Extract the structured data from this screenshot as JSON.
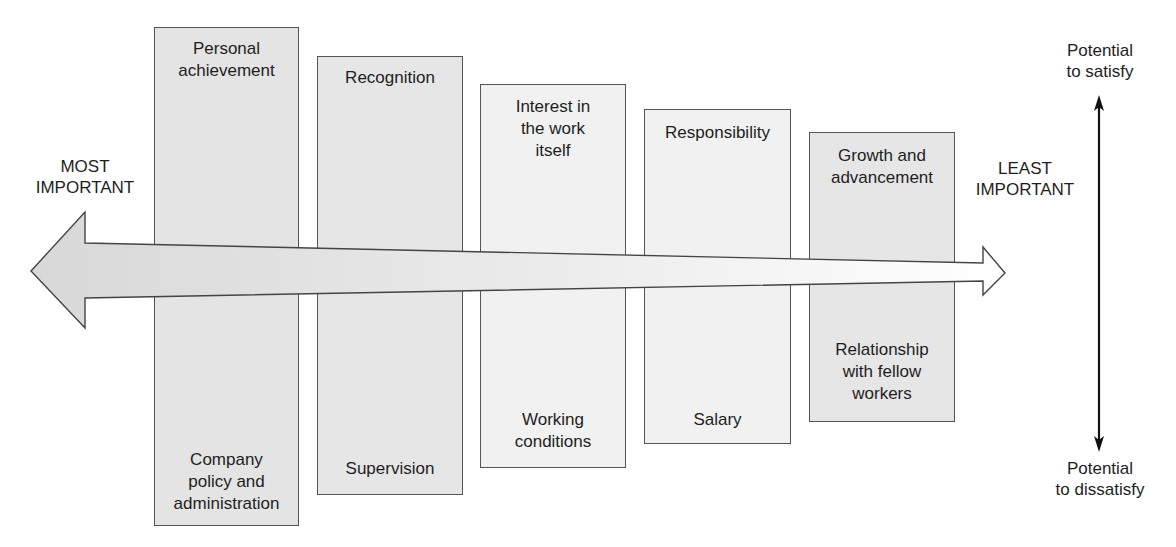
{
  "diagram": {
    "type": "factor-importance-comparison",
    "left_label": "MOST\nIMPORTANT",
    "right_label": "LEAST\nIMPORTANT",
    "axis": {
      "top_label": "Potential\nto satisfy",
      "bottom_label": "Potential\nto dissatisfy"
    },
    "factors": [
      {
        "satisfier": "Personal\nachievement",
        "dissatisfier": "Company\npolicy and\nadministration"
      },
      {
        "satisfier": "Recognition",
        "dissatisfier": "Supervision"
      },
      {
        "satisfier": "Interest in\nthe work\nitself",
        "dissatisfier": "Working\nconditions"
      },
      {
        "satisfier": "Responsibility",
        "dissatisfier": "Salary"
      },
      {
        "satisfier": "Growth and\nadvancement",
        "dissatisfier": "Relationship\nwith fellow\nworkers"
      }
    ],
    "colors": {
      "box_fill_dark": "#e4e4e4",
      "box_fill_light": "#f1f1f1",
      "outline": "#555555",
      "arrow_left": "#dcdcdc",
      "arrow_right": "#ffffff",
      "axis_arrow": "#111111"
    }
  }
}
